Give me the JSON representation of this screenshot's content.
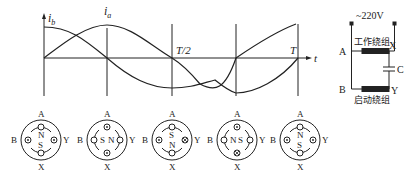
{
  "waveform": {
    "y_axis_label_b": "i",
    "y_axis_label_b_sub": "b",
    "curve_label_a": "i",
    "curve_label_a_sub": "a",
    "half_period_label": "T/2",
    "period_label": "T",
    "t_axis_label": "t"
  },
  "circuit": {
    "supply_label": "~220V",
    "work_winding_label": "工作绕组",
    "start_winding_label": "启动绕组",
    "terminal_a": "A",
    "terminal_b": "B",
    "terminal_x": "X",
    "terminal_y": "Y",
    "capacitor_label": "C"
  },
  "motors": [
    {
      "top": "A",
      "bottom": "X",
      "left": "B",
      "right": "Y",
      "rotor_top": "N",
      "rotor_bottom": "S",
      "orientation": "vertical",
      "a_mark": "empty",
      "x_mark": "empty",
      "b_mark": "dot",
      "y_mark": "dot"
    },
    {
      "top": "A",
      "bottom": "X",
      "left": "B",
      "right": "Y",
      "rotor_top": "S",
      "rotor_bottom": "N",
      "orientation": "horizontal",
      "a_mark": "dot",
      "x_mark": "dot",
      "b_mark": "empty",
      "y_mark": "empty"
    },
    {
      "top": "A",
      "bottom": "X",
      "left": "B",
      "right": "Y",
      "rotor_top": "S",
      "rotor_bottom": "N",
      "orientation": "vertical",
      "a_mark": "empty",
      "x_mark": "empty",
      "b_mark": "dot",
      "y_mark": "cross"
    },
    {
      "top": "A",
      "bottom": "X",
      "left": "B",
      "right": "Y",
      "rotor_top": "N",
      "rotor_bottom": "S",
      "orientation": "horizontal",
      "a_mark": "dot",
      "x_mark": "cross",
      "b_mark": "empty",
      "y_mark": "empty"
    },
    {
      "top": "A",
      "bottom": "X",
      "left": "B",
      "right": "Y",
      "rotor_top": "N",
      "rotor_bottom": "S",
      "orientation": "vertical",
      "a_mark": "empty",
      "x_mark": "empty",
      "b_mark": "dot",
      "y_mark": "dot"
    }
  ]
}
